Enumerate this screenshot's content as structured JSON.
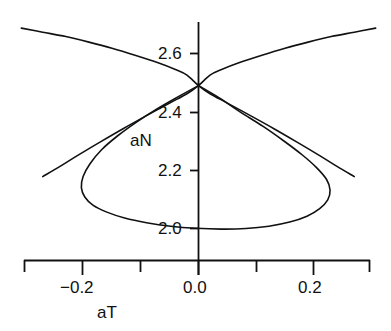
{
  "chart_data": {
    "type": "line",
    "title": "",
    "subtitle": "",
    "xlabel": "aT",
    "ylabel": "aN",
    "xlim": [
      -0.3,
      0.3
    ],
    "ylim": [
      1.93,
      2.72
    ],
    "grid": false,
    "legend": null,
    "xticks": [
      -0.3,
      -0.2,
      -0.1,
      0.0,
      0.1,
      0.2,
      0.3
    ],
    "xtick_labels": [
      "",
      "−0.2",
      "",
      "0.0",
      "",
      "0.2",
      ""
    ],
    "yticks": [
      2.0,
      2.2,
      2.4,
      2.6
    ],
    "ytick_labels": [
      "2.0",
      "2.2",
      "2.4",
      "2.6"
    ],
    "annotations": [
      {
        "text": "aN",
        "x": -0.095,
        "y": 2.31
      }
    ],
    "series": [
      {
        "name": "upper-branch-descending",
        "type": "line",
        "points": [
          [
            -0.307,
            2.687
          ],
          [
            -0.27,
            2.673
          ],
          [
            -0.23,
            2.658
          ],
          [
            -0.19,
            2.639
          ],
          [
            -0.15,
            2.618
          ],
          [
            -0.11,
            2.594
          ],
          [
            -0.07,
            2.568
          ],
          [
            -0.04,
            2.545
          ],
          [
            -0.02,
            2.526
          ],
          [
            0.0,
            2.49
          ],
          [
            0.02,
            2.462
          ],
          [
            0.05,
            2.43
          ],
          [
            0.09,
            2.387
          ],
          [
            0.13,
            2.343
          ],
          [
            0.17,
            2.297
          ],
          [
            0.21,
            2.25
          ],
          [
            0.24,
            2.213
          ],
          [
            0.27,
            2.178
          ]
        ]
      },
      {
        "name": "upper-branch-ascending",
        "type": "line",
        "points": [
          [
            0.307,
            2.687
          ],
          [
            0.27,
            2.673
          ],
          [
            0.23,
            2.658
          ],
          [
            0.19,
            2.639
          ],
          [
            0.15,
            2.618
          ],
          [
            0.11,
            2.594
          ],
          [
            0.07,
            2.568
          ],
          [
            0.04,
            2.545
          ],
          [
            0.02,
            2.526
          ],
          [
            0.0,
            2.49
          ],
          [
            -0.02,
            2.462
          ],
          [
            -0.05,
            2.43
          ],
          [
            -0.09,
            2.387
          ],
          [
            -0.13,
            2.343
          ],
          [
            -0.17,
            2.297
          ],
          [
            -0.21,
            2.25
          ],
          [
            -0.24,
            2.213
          ],
          [
            -0.27,
            2.178
          ]
        ]
      },
      {
        "name": "closed-loop",
        "type": "closed-curve",
        "points": [
          [
            0.0,
            2.49
          ],
          [
            -0.035,
            2.452
          ],
          [
            -0.072,
            2.41
          ],
          [
            -0.108,
            2.364
          ],
          [
            -0.14,
            2.318
          ],
          [
            -0.168,
            2.27
          ],
          [
            -0.188,
            2.222
          ],
          [
            -0.2,
            2.178
          ],
          [
            -0.203,
            2.14
          ],
          [
            -0.197,
            2.108
          ],
          [
            -0.183,
            2.08
          ],
          [
            -0.16,
            2.057
          ],
          [
            -0.128,
            2.036
          ],
          [
            -0.09,
            2.02
          ],
          [
            -0.048,
            2.008
          ],
          [
            -0.005,
            2.001
          ],
          [
            0.04,
            1.998
          ],
          [
            0.082,
            2.0
          ],
          [
            0.122,
            2.008
          ],
          [
            0.158,
            2.022
          ],
          [
            0.188,
            2.042
          ],
          [
            0.21,
            2.068
          ],
          [
            0.224,
            2.098
          ],
          [
            0.228,
            2.132
          ],
          [
            0.222,
            2.168
          ],
          [
            0.205,
            2.208
          ],
          [
            0.18,
            2.252
          ],
          [
            0.148,
            2.3
          ],
          [
            0.112,
            2.35
          ],
          [
            0.072,
            2.4
          ],
          [
            0.036,
            2.448
          ],
          [
            0.0,
            2.49
          ]
        ]
      }
    ]
  },
  "axes": {
    "x_axis_line": {
      "name": "x-axis-spine"
    },
    "y_axis_line": {
      "name": "y-axis-spine"
    }
  },
  "labels": {
    "x_tick_minus_02": "−0.2",
    "x_tick_00": "0.0",
    "x_tick_02": "0.2",
    "y_tick_26": "2.6",
    "y_tick_24": "2.4",
    "y_tick_22": "2.2",
    "y_tick_20": "2.0",
    "x_axis_title": "aT",
    "curve_label_an": "aN"
  },
  "style": {
    "line_color": "#111111",
    "axis_color": "#111111",
    "background": "#ffffff",
    "line_width": "1.6"
  }
}
